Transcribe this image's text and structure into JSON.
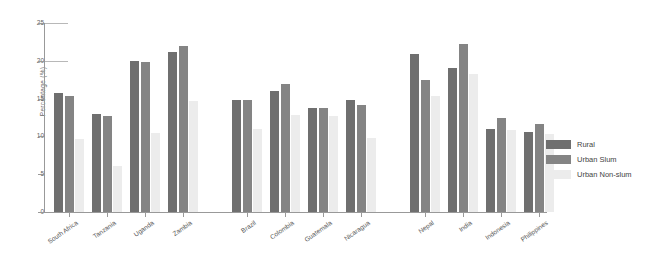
{
  "chart_data": {
    "type": "bar",
    "title": "",
    "subtitle": "",
    "xlabel": "",
    "ylabel": "Percentage (%)",
    "ylim": [
      0,
      25
    ],
    "yticks": [
      0,
      5,
      10,
      15,
      20,
      25
    ],
    "grid": false,
    "legend_position": "right",
    "categories": [
      "South Africa",
      "Tanzania",
      "Uganda",
      "Zambia",
      "Brazil",
      "Colombia",
      "Guatemala",
      "Nicaragua",
      "Nepal",
      "India",
      "Indonesia",
      "Philippines"
    ],
    "category_groups": [
      {
        "name": "Africa",
        "categories": [
          "South Africa",
          "Tanzania",
          "Uganda",
          "Zambia"
        ]
      },
      {
        "name": "Latin America",
        "categories": [
          "Brazil",
          "Colombia",
          "Guatemala",
          "Nicaragua"
        ]
      },
      {
        "name": "Asia",
        "categories": [
          "Nepal",
          "India",
          "Indonesia",
          "Philippines"
        ]
      }
    ],
    "series": [
      {
        "name": "Rural",
        "color": "#6f6f6f",
        "values": [
          15.7,
          13.0,
          20.0,
          21.2,
          14.8,
          16.0,
          13.7,
          14.8,
          20.9,
          19.1,
          11.0,
          10.6
        ]
      },
      {
        "name": "Urban Slum",
        "color": "#848484",
        "values": [
          15.4,
          12.7,
          19.8,
          22.0,
          14.8,
          16.9,
          13.8,
          14.2,
          17.5,
          22.2,
          12.4,
          11.6
        ]
      },
      {
        "name": "Urban Non-slum",
        "color": "#ececec",
        "values": [
          9.7,
          6.1,
          10.5,
          14.7,
          11.0,
          12.8,
          12.7,
          9.8,
          15.4,
          18.3,
          10.8,
          10.3
        ]
      }
    ]
  },
  "axes": {
    "y_label": "Percentage (%)",
    "y_ticks": [
      "0",
      "5",
      "10",
      "15",
      "20",
      "25"
    ]
  },
  "legend": {
    "items": [
      {
        "label": "Rural",
        "color": "#6f6f6f"
      },
      {
        "label": "Urban Slum",
        "color": "#848484"
      },
      {
        "label": "Urban Non-slum",
        "color": "#ececec"
      }
    ]
  }
}
